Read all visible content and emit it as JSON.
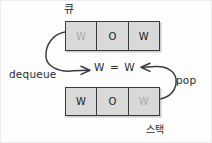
{
  "diagram": {
    "background_color": "#fdfdfd",
    "ink_color": "#2b2b2b",
    "cell_fill_color": "#d9d9d9",
    "cell_border_color": "#3b3b3b",
    "dim_letter_color": "#a9a9a9"
  },
  "queue": {
    "title": "큐",
    "cells": [
      {
        "letter": "W",
        "dim": true
      },
      {
        "letter": "O",
        "dim": false
      },
      {
        "letter": "W",
        "dim": false
      }
    ]
  },
  "stack": {
    "title": "스택",
    "cells": [
      {
        "letter": "W",
        "dim": false
      },
      {
        "letter": "O",
        "dim": false
      },
      {
        "letter": "W",
        "dim": true
      }
    ]
  },
  "operations": {
    "dequeue_label": "dequeue",
    "pop_label": "pop"
  },
  "comparison": {
    "text": "W = W"
  }
}
